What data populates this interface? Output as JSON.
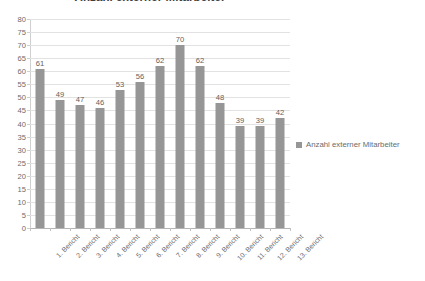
{
  "chart_data": {
    "type": "bar",
    "title": "Anzahl externer Mitarbeiter",
    "xlabel": "",
    "ylabel": "",
    "ylim": [
      0,
      80
    ],
    "ytick_step": 5,
    "yticks": [
      80,
      75,
      70,
      65,
      60,
      55,
      50,
      45,
      40,
      35,
      30,
      25,
      20,
      15,
      10,
      5,
      0
    ],
    "grid": true,
    "legend_position": "right",
    "legend": [
      "Anzahl externer Mitarbeiter"
    ],
    "series_name": "Anzahl externer Mitarbeiter",
    "bar_color": "#969696",
    "categories": [
      "1. Bericht",
      "2. Bericht",
      "3. Bericht",
      "4. Bericht",
      "5. Bericht",
      "6. Bericht",
      "7. Bericht",
      "8. Bericht",
      "9. Bericht",
      "10. Bericht",
      "11. Bericht",
      "12. Bericht",
      "13. Bericht"
    ],
    "values": [
      61,
      49,
      47,
      46,
      53,
      56,
      62,
      70,
      62,
      48,
      39,
      39,
      42
    ],
    "data_labels_shown": true
  },
  "colors": {
    "background": "#ffffff",
    "bar": "#969696",
    "gridline": "#e2e2e2",
    "axis": "#b5b5b5",
    "text": "#6b6b6b",
    "title_text": "#404040"
  }
}
